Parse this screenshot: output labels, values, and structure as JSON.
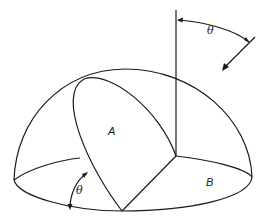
{
  "diagram": {
    "type": "hemisphere-solar-geometry",
    "labels": {
      "plane_a": "A",
      "plane_b": "B",
      "angle_top": "θ",
      "angle_bottom": "θ"
    },
    "colors": {
      "stroke": "#1a1a1a",
      "background": "#ffffff"
    }
  }
}
